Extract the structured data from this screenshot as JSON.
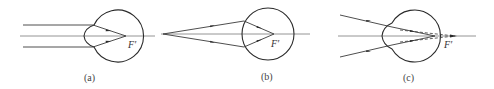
{
  "figure": {
    "panels": [
      {
        "id": "a",
        "caption": "(a)",
        "focus_label": "F′",
        "description": "Parallel rays focus on the retina (normal eye)"
      },
      {
        "id": "b",
        "caption": "(b)",
        "focus_label": "F′",
        "description": "Rays from a near point converge at F′ inside the eye"
      },
      {
        "id": "c",
        "caption": "(c)",
        "focus_label": "F′",
        "description": "Converging rays focus behind the retina, dashed extensions to F′"
      }
    ]
  }
}
